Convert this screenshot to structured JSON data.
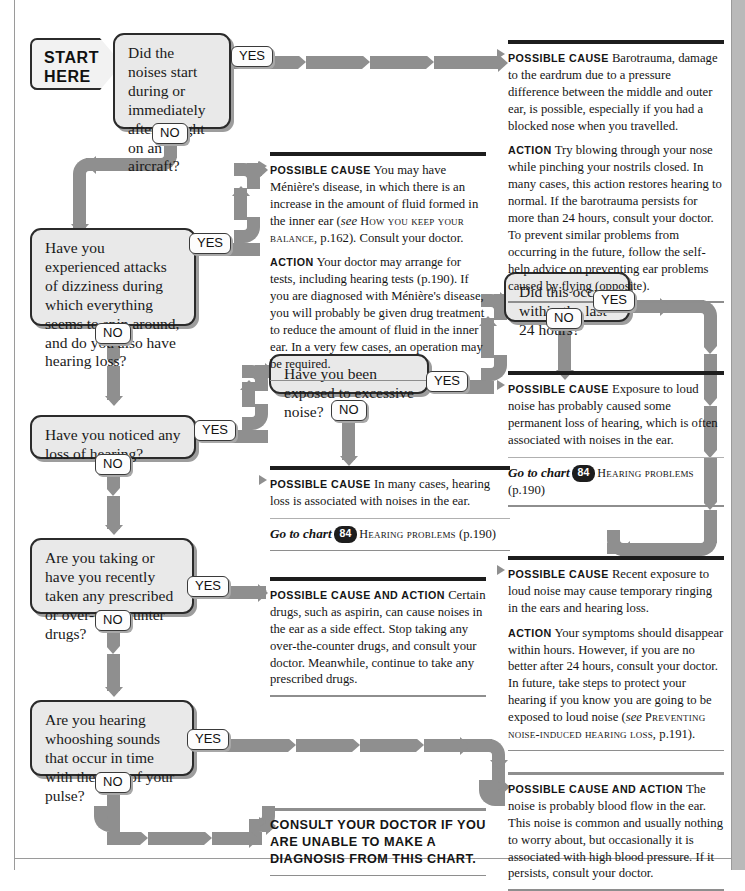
{
  "start": {
    "line1": "START",
    "line2": "HERE"
  },
  "labels": {
    "yes": "YES",
    "no": "NO"
  },
  "questions": {
    "q1": "Did the noises start during or immediately after a flight on an aircraft?",
    "q2": "Have you experienced attacks of dizziness during which everything seems to spin around, and do you also have hearing loss?",
    "q3": "Have you noticed any loss of hearing?",
    "q4": "Are you taking or have you recently taken any prescribed or over-the-counter drugs?",
    "q5": "Are you hearing whooshing sounds that occur in time with the beat of your pulse?",
    "q6": "Have you been exposed to excessive noise?",
    "q7": "Did this occur within the last 24 hours?"
  },
  "blocks": {
    "barotrauma": {
      "cause_label": "Possible cause",
      "cause_text": "Barotrauma, damage to the eardrum due to a pressure difference between the middle and outer ear, is possible, especially if you had a blocked nose when you travelled.",
      "action_label": "Action",
      "action_text_1": "Try blowing through your nose while pinching your nostrils closed. In many cases, this action restores hearing to normal. If the barotrauma persists for more than 24 hours, consult your doctor. To prevent similar problems from occurring in the future, follow the self-help advice on preventing ear problems caused by flying (opposite)."
    },
    "meniere": {
      "cause_label": "Possible cause",
      "cause_text_1": "You may have Ménière's disease, in which there is an increase in the amount of fluid formed in the inner ear (",
      "cause_see": "see",
      "cause_ref": "How you keep your balance,",
      "cause_text_2": " p.162). Consult your doctor.",
      "action_label": "Action",
      "action_text": "Your doctor may arrange for tests, including hearing tests (p.190). If you are diagnosed with Ménière's disease, you will probably be given drug treatment to reduce the amount of fluid in the inner ear. In a very few cases, an operation may be required."
    },
    "permanent_loss": {
      "cause_label": "Possible cause",
      "cause_text": "Exposure to loud noise has probably caused some permanent loss of hearing, which is often associated with noises in the ear.",
      "goto_label": "Go to chart",
      "chart_number": "84",
      "chart_title": "Hearing problems",
      "chart_page": "(p.190)"
    },
    "hearing_loss": {
      "cause_label": "Possible cause",
      "cause_text": "In many cases, hearing loss is associated with noises in the ear.",
      "goto_label": "Go to chart",
      "chart_number": "84",
      "chart_title": "Hearing problems",
      "chart_page": "(p.190)"
    },
    "drugs": {
      "cause_label": "Possible cause and action",
      "cause_text": "Certain drugs, such as aspirin, can cause noises in the ear as a side effect. Stop taking any over-the-counter drugs, and consult your doctor. Meanwhile, continue to take any prescribed drugs."
    },
    "recent_noise": {
      "cause_label": "Possible cause",
      "cause_text": "Recent exposure to loud noise may cause temporary ringing in the ears and hearing loss.",
      "action_label": "Action",
      "action_text_1": "Your symptoms should disappear within hours. However, if you are no better after 24 hours, consult your doctor. In future, take steps to protect your hearing if you know you are going to be exposed to loud noise (",
      "action_see": "see",
      "action_ref": "Preventing noise-induced hearing loss,",
      "action_text_2": " p.191)."
    },
    "blood_flow": {
      "cause_label": "Possible cause and action",
      "cause_text": "The noise is probably blood flow in the ear. This noise is common and usually nothing to worry about, but occasionally it is associated with high blood pressure. If it persists, consult your doctor."
    },
    "consult": {
      "text": "Consult your doctor if you are unable to make a diagnosis from this chart."
    }
  }
}
